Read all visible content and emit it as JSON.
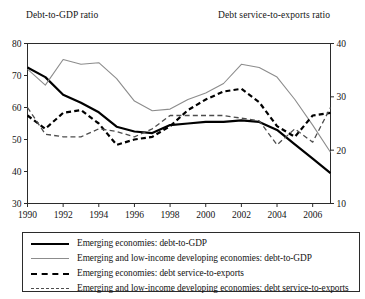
{
  "figure": {
    "left_axis_caption": "Debt-to-GDP ratio",
    "right_axis_caption": "Debt service-to-exports ratio"
  },
  "legend": {
    "items": [
      {
        "label": "Emerging economies: debt-to-GDP",
        "style": "solid-thick",
        "color": "#000000"
      },
      {
        "label": "Emerging and low-income developing economies: debt-to-GDP",
        "style": "solid-thin",
        "color": "#8c8c8c"
      },
      {
        "label": "Emerging economies: debt service-to-exports",
        "style": "dash-thick",
        "color": "#000000"
      },
      {
        "label": "Emerging and low-income developing economies: debt service-to-exports",
        "style": "dash-thin",
        "color": "#4d4d4d"
      }
    ]
  },
  "chart_data": {
    "type": "line",
    "title": "",
    "xlabel": "",
    "ylabel": "Debt-to-GDP ratio",
    "y2label": "Debt service-to-exports ratio",
    "grid": false,
    "legend_position": "bottom",
    "x": [
      1990,
      1991,
      1992,
      1993,
      1994,
      1995,
      1996,
      1997,
      1998,
      1999,
      2000,
      2001,
      2002,
      2003,
      2004,
      2005,
      2006,
      2007
    ],
    "xlim": [
      1990,
      2007
    ],
    "xticks": [
      1990,
      1992,
      1994,
      1996,
      1998,
      2000,
      2002,
      2004,
      2006
    ],
    "ylim": [
      30,
      80
    ],
    "yticks": [
      30,
      40,
      50,
      60,
      70,
      80
    ],
    "y2lim": [
      10,
      40
    ],
    "y2ticks": [
      10,
      20,
      30,
      40
    ],
    "series": [
      {
        "name": "Emerging economies: debt-to-GDP",
        "axis": "left",
        "style": "solid-thick",
        "color": "#000000",
        "values": [
          72.5,
          69.5,
          64.0,
          61.5,
          58.5,
          54.0,
          52.5,
          52.0,
          54.5,
          55.0,
          55.5,
          55.5,
          56.0,
          55.5,
          53.0,
          48.5,
          44.0,
          39.5
        ]
      },
      {
        "name": "Emerging and low-income developing economies: debt-to-GDP",
        "axis": "left",
        "style": "solid-thin",
        "color": "#8c8c8c",
        "values": [
          72.0,
          67.0,
          75.0,
          73.5,
          74.0,
          69.0,
          62.0,
          59.0,
          59.5,
          62.5,
          64.5,
          67.5,
          73.5,
          72.5,
          69.5,
          62.5,
          54.5,
          46.0
        ]
      },
      {
        "name": "Emerging economies: debt service-to-exports",
        "axis": "right",
        "style": "dash-thick",
        "color": "#000000",
        "values": [
          26.5,
          24.0,
          27.0,
          27.5,
          25.0,
          21.0,
          22.0,
          22.5,
          24.5,
          27.5,
          29.5,
          31.0,
          31.5,
          29.0,
          24.5,
          22.5,
          26.5,
          27.0
        ]
      },
      {
        "name": "Emerging and low-income developing economies: debt service-to-exports",
        "axis": "right",
        "style": "dash-thin",
        "color": "#4d4d4d",
        "values": [
          28.0,
          23.0,
          22.5,
          22.5,
          24.0,
          23.5,
          22.5,
          24.0,
          26.5,
          26.5,
          26.5,
          26.5,
          26.0,
          25.5,
          21.0,
          24.0,
          21.5,
          28.0
        ]
      }
    ]
  }
}
